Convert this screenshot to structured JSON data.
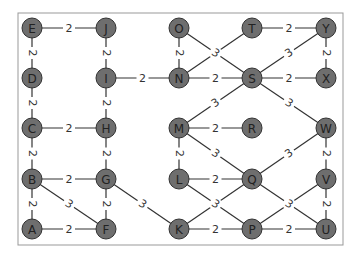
{
  "diagram": {
    "type": "weighted-graph",
    "colors": {
      "node_fill": "#6e6e6e",
      "node_stroke": "#333333",
      "edge": "#333333",
      "label_text": "#333333",
      "frame": "#999999",
      "background": "#ffffff"
    },
    "frame": {
      "x": 18,
      "y": 13,
      "width": 325,
      "height": 232
    },
    "node_radius": 10,
    "nodes": [
      {
        "id": "E",
        "x": 32,
        "y": 28
      },
      {
        "id": "J",
        "x": 106,
        "y": 28
      },
      {
        "id": "O",
        "x": 179,
        "y": 28
      },
      {
        "id": "T",
        "x": 252,
        "y": 28
      },
      {
        "id": "Y",
        "x": 326,
        "y": 28
      },
      {
        "id": "D",
        "x": 32,
        "y": 78
      },
      {
        "id": "I",
        "x": 106,
        "y": 78
      },
      {
        "id": "N",
        "x": 179,
        "y": 78
      },
      {
        "id": "S",
        "x": 252,
        "y": 78
      },
      {
        "id": "X",
        "x": 326,
        "y": 78
      },
      {
        "id": "C",
        "x": 32,
        "y": 128
      },
      {
        "id": "H",
        "x": 106,
        "y": 128
      },
      {
        "id": "M",
        "x": 179,
        "y": 128
      },
      {
        "id": "R",
        "x": 252,
        "y": 128
      },
      {
        "id": "W",
        "x": 326,
        "y": 128
      },
      {
        "id": "B",
        "x": 32,
        "y": 179
      },
      {
        "id": "G",
        "x": 106,
        "y": 179
      },
      {
        "id": "L",
        "x": 179,
        "y": 179
      },
      {
        "id": "Q",
        "x": 252,
        "y": 179
      },
      {
        "id": "V",
        "x": 326,
        "y": 179
      },
      {
        "id": "A",
        "x": 32,
        "y": 229
      },
      {
        "id": "F",
        "x": 106,
        "y": 229
      },
      {
        "id": "K",
        "x": 179,
        "y": 229
      },
      {
        "id": "P",
        "x": 252,
        "y": 229
      },
      {
        "id": "U",
        "x": 326,
        "y": 229
      }
    ],
    "edges": [
      {
        "from": "E",
        "to": "J",
        "weight": "2"
      },
      {
        "from": "E",
        "to": "D",
        "weight": "2"
      },
      {
        "from": "J",
        "to": "I",
        "weight": "2"
      },
      {
        "from": "D",
        "to": "C",
        "weight": "2"
      },
      {
        "from": "I",
        "to": "N",
        "weight": "2"
      },
      {
        "from": "I",
        "to": "H",
        "weight": "2"
      },
      {
        "from": "C",
        "to": "H",
        "weight": "2"
      },
      {
        "from": "C",
        "to": "B",
        "weight": "2"
      },
      {
        "from": "H",
        "to": "G",
        "weight": "2"
      },
      {
        "from": "B",
        "to": "G",
        "weight": "2"
      },
      {
        "from": "B",
        "to": "A",
        "weight": "2"
      },
      {
        "from": "B",
        "to": "F",
        "weight": "3"
      },
      {
        "from": "G",
        "to": "F",
        "weight": "2"
      },
      {
        "from": "G",
        "to": "K",
        "weight": "3"
      },
      {
        "from": "A",
        "to": "F",
        "weight": "2"
      },
      {
        "from": "O",
        "to": "N",
        "weight": "2"
      },
      {
        "from": "O",
        "to": "S",
        "weight": "3"
      },
      {
        "from": "N",
        "to": "T",
        "weight": "3",
        "hide_label": true
      },
      {
        "from": "N",
        "to": "S",
        "weight": "2"
      },
      {
        "from": "T",
        "to": "Y",
        "weight": "2"
      },
      {
        "from": "Y",
        "to": "X",
        "weight": "2"
      },
      {
        "from": "S",
        "to": "Y",
        "weight": "3"
      },
      {
        "from": "S",
        "to": "X",
        "weight": "2"
      },
      {
        "from": "S",
        "to": "M",
        "weight": "3"
      },
      {
        "from": "S",
        "to": "W",
        "weight": "3"
      },
      {
        "from": "M",
        "to": "R",
        "weight": "2"
      },
      {
        "from": "M",
        "to": "L",
        "weight": "2"
      },
      {
        "from": "M",
        "to": "Q",
        "weight": "3"
      },
      {
        "from": "W",
        "to": "Q",
        "weight": "3"
      },
      {
        "from": "W",
        "to": "V",
        "weight": "2"
      },
      {
        "from": "L",
        "to": "Q",
        "weight": "2"
      },
      {
        "from": "L",
        "to": "P",
        "weight": "3"
      },
      {
        "from": "K",
        "to": "Q",
        "weight": "3",
        "hide_label": true
      },
      {
        "from": "K",
        "to": "P",
        "weight": "2"
      },
      {
        "from": "Q",
        "to": "U",
        "weight": "3"
      },
      {
        "from": "P",
        "to": "V",
        "weight": "3",
        "hide_label": true
      },
      {
        "from": "P",
        "to": "U",
        "weight": "2"
      },
      {
        "from": "V",
        "to": "U",
        "weight": "2"
      }
    ]
  }
}
